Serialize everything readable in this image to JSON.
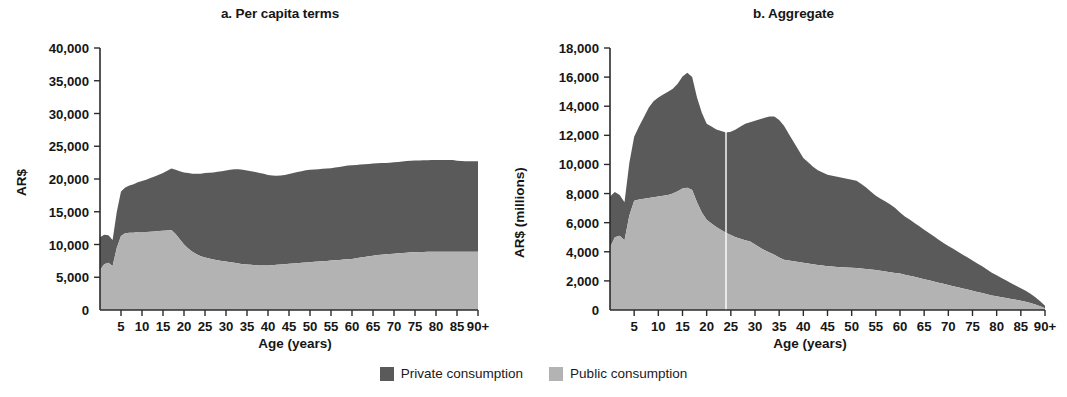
{
  "figure": {
    "panels": [
      {
        "key": "per_capita",
        "title": "a. Per capita terms",
        "ylabel": "AR$",
        "xlabel": "Age (years)"
      },
      {
        "key": "aggregate",
        "title": "b. Aggregate",
        "ylabel": "AR$ (millions)",
        "xlabel": "Age (years)"
      }
    ]
  },
  "legend": {
    "position": "bottom-center",
    "items": [
      {
        "label": "Private consumption",
        "color": "#5a5a5a",
        "name": "private-consumption"
      },
      {
        "label": "Public consumption",
        "color": "#b3b3b3",
        "name": "public-consumption"
      }
    ]
  },
  "colors": {
    "private": "#5a5a5a",
    "public": "#b3b3b3",
    "axis": "#2b2b2b",
    "text": "#161616",
    "background": "#ffffff"
  },
  "chart_data": [
    {
      "type": "area",
      "stacked": true,
      "title": "a. Per capita terms",
      "xlabel": "Age (years)",
      "ylabel": "AR$",
      "ylim": [
        0,
        40000
      ],
      "yticks": [
        0,
        5000,
        10000,
        15000,
        20000,
        25000,
        30000,
        35000,
        40000
      ],
      "ytick_labels": [
        "0",
        "5,000",
        "10,000",
        "15,000",
        "20,000",
        "25,000",
        "30,000",
        "35,000",
        "40,000"
      ],
      "xlim": [
        0,
        90
      ],
      "xticks": [
        5,
        10,
        15,
        20,
        25,
        30,
        35,
        40,
        45,
        50,
        55,
        60,
        65,
        70,
        75,
        80,
        85,
        90
      ],
      "xtick_labels": [
        "5",
        "10",
        "15",
        "20",
        "25",
        "30",
        "35",
        "40",
        "45",
        "50",
        "55",
        "60",
        "65",
        "70",
        "75",
        "80",
        "85",
        "90+"
      ],
      "grid": false,
      "x": [
        0,
        1,
        2,
        3,
        4,
        5,
        6,
        7,
        8,
        9,
        10,
        11,
        12,
        13,
        14,
        15,
        16,
        17,
        18,
        19,
        20,
        21,
        22,
        23,
        24,
        25,
        26,
        27,
        28,
        29,
        30,
        31,
        32,
        33,
        34,
        35,
        36,
        37,
        38,
        39,
        40,
        41,
        42,
        43,
        44,
        45,
        46,
        47,
        48,
        49,
        50,
        51,
        52,
        53,
        54,
        55,
        56,
        57,
        58,
        59,
        60,
        61,
        62,
        63,
        64,
        65,
        66,
        67,
        68,
        69,
        70,
        71,
        72,
        73,
        74,
        75,
        76,
        77,
        78,
        79,
        80,
        81,
        82,
        83,
        84,
        85,
        86,
        87,
        88,
        89,
        90
      ],
      "series": [
        {
          "name": "Public consumption",
          "values": [
            6100,
            7000,
            7200,
            6700,
            9500,
            11300,
            11700,
            11800,
            11800,
            11900,
            11900,
            11900,
            11950,
            12000,
            12050,
            12100,
            12150,
            12200,
            11600,
            10800,
            10000,
            9400,
            8900,
            8500,
            8200,
            8000,
            7850,
            7700,
            7600,
            7500,
            7400,
            7300,
            7200,
            7100,
            7000,
            6950,
            6900,
            6850,
            6800,
            6800,
            6800,
            6850,
            6900,
            6950,
            7000,
            7050,
            7100,
            7150,
            7200,
            7250,
            7300,
            7350,
            7400,
            7450,
            7500,
            7550,
            7600,
            7650,
            7700,
            7750,
            7800,
            7900,
            8000,
            8100,
            8200,
            8300,
            8400,
            8450,
            8500,
            8550,
            8600,
            8650,
            8700,
            8750,
            8800,
            8820,
            8840,
            8860,
            8880,
            8900,
            8900,
            8900,
            8900,
            8900,
            8900,
            8900,
            8900,
            8900,
            8900,
            8900,
            8900
          ]
        },
        {
          "name": "Private consumption",
          "values": [
            5000,
            4500,
            4200,
            4000,
            5500,
            6800,
            7000,
            7200,
            7400,
            7600,
            7800,
            8000,
            8200,
            8400,
            8600,
            8800,
            9100,
            9400,
            9800,
            10400,
            11000,
            11500,
            11900,
            12300,
            12600,
            12900,
            13100,
            13300,
            13500,
            13700,
            13900,
            14100,
            14300,
            14400,
            14400,
            14350,
            14300,
            14200,
            14100,
            14000,
            13800,
            13700,
            13600,
            13600,
            13600,
            13700,
            13800,
            13900,
            14000,
            14100,
            14100,
            14100,
            14100,
            14100,
            14100,
            14100,
            14150,
            14200,
            14250,
            14300,
            14300,
            14250,
            14200,
            14150,
            14100,
            14050,
            14000,
            13980,
            13960,
            13950,
            13950,
            13960,
            13980,
            14000,
            14000,
            14000,
            14000,
            14000,
            14000,
            14000,
            14000,
            14000,
            14000,
            14000,
            14000,
            13900,
            13850,
            13800,
            13800,
            13800,
            13800
          ]
        }
      ],
      "totals_note": "Stacked: public (bottom) + private (top); totals rise from ~11,100 at age 0 to ~22,700 at 90+"
    },
    {
      "type": "area",
      "stacked": true,
      "title": "b. Aggregate",
      "xlabel": "Age (years)",
      "ylabel": "AR$ (millions)",
      "ylim": [
        0,
        18000
      ],
      "yticks": [
        0,
        2000,
        4000,
        6000,
        8000,
        10000,
        12000,
        14000,
        16000,
        18000
      ],
      "ytick_labels": [
        "0",
        "2,000",
        "4,000",
        "6,000",
        "8,000",
        "10,000",
        "12,000",
        "14,000",
        "16,000",
        "18,000"
      ],
      "xlim": [
        0,
        90
      ],
      "xticks": [
        5,
        10,
        15,
        20,
        25,
        30,
        35,
        40,
        45,
        50,
        55,
        60,
        65,
        70,
        75,
        80,
        85,
        90
      ],
      "xtick_labels": [
        "5",
        "10",
        "15",
        "20",
        "25",
        "30",
        "35",
        "40",
        "45",
        "50",
        "55",
        "60",
        "65",
        "70",
        "75",
        "80",
        "85",
        "90+"
      ],
      "grid": false,
      "x": [
        0,
        1,
        2,
        3,
        4,
        5,
        6,
        7,
        8,
        9,
        10,
        11,
        12,
        13,
        14,
        15,
        16,
        17,
        18,
        19,
        20,
        21,
        22,
        23,
        24,
        25,
        26,
        27,
        28,
        29,
        30,
        31,
        32,
        33,
        34,
        35,
        36,
        37,
        38,
        39,
        40,
        41,
        42,
        43,
        44,
        45,
        46,
        47,
        48,
        49,
        50,
        51,
        52,
        53,
        54,
        55,
        56,
        57,
        58,
        59,
        60,
        61,
        62,
        63,
        64,
        65,
        66,
        67,
        68,
        69,
        70,
        71,
        72,
        73,
        74,
        75,
        76,
        77,
        78,
        79,
        80,
        81,
        82,
        83,
        84,
        85,
        86,
        87,
        88,
        89,
        90
      ],
      "series": [
        {
          "name": "Public consumption",
          "values": [
            4300,
            5000,
            5100,
            4800,
            6500,
            7500,
            7600,
            7650,
            7700,
            7750,
            7800,
            7850,
            7900,
            8000,
            8150,
            8350,
            8400,
            8250,
            7400,
            6700,
            6200,
            5950,
            5700,
            5500,
            5300,
            5150,
            5000,
            4900,
            4800,
            4700,
            4500,
            4300,
            4100,
            3950,
            3800,
            3600,
            3450,
            3400,
            3350,
            3300,
            3250,
            3200,
            3150,
            3100,
            3050,
            3000,
            2980,
            2960,
            2940,
            2920,
            2900,
            2880,
            2850,
            2820,
            2780,
            2750,
            2700,
            2650,
            2600,
            2550,
            2500,
            2430,
            2360,
            2280,
            2200,
            2120,
            2040,
            1960,
            1880,
            1800,
            1720,
            1640,
            1560,
            1480,
            1400,
            1320,
            1240,
            1160,
            1080,
            1000,
            940,
            880,
            820,
            760,
            700,
            640,
            560,
            480,
            380,
            260,
            120
          ]
        },
        {
          "name": "Private consumption",
          "values": [
            3500,
            3100,
            2800,
            2600,
            3600,
            4400,
            5000,
            5600,
            6200,
            6600,
            6800,
            6950,
            7100,
            7200,
            7400,
            7700,
            7900,
            7750,
            7200,
            6850,
            6600,
            6650,
            6700,
            6800,
            6900,
            7100,
            7400,
            7700,
            8000,
            8200,
            8500,
            8800,
            9100,
            9350,
            9500,
            9450,
            9200,
            8700,
            8200,
            7700,
            7200,
            6950,
            6700,
            6500,
            6400,
            6300,
            6250,
            6200,
            6150,
            6100,
            6050,
            6000,
            5800,
            5600,
            5350,
            5100,
            4950,
            4800,
            4650,
            4450,
            4200,
            4000,
            3850,
            3700,
            3550,
            3400,
            3250,
            3100,
            2950,
            2800,
            2680,
            2560,
            2440,
            2320,
            2200,
            2080,
            1960,
            1840,
            1700,
            1560,
            1440,
            1320,
            1200,
            1080,
            960,
            860,
            760,
            640,
            500,
            340,
            180
          ]
        }
      ],
      "annotations": [
        {
          "type": "vertical-line",
          "x": 24,
          "color": "#ffffff",
          "note": "white gridline near age 24"
        }
      ],
      "totals_note": "Stacked totals peak ~14,800 around ages 15-16 and ~14,750 around age 33, declining to near 0 at 90+"
    }
  ]
}
